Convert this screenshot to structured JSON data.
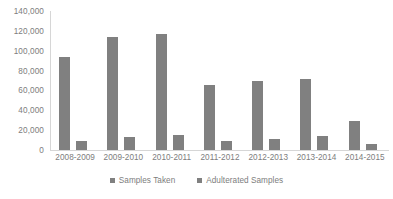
{
  "chart_data": {
    "type": "bar",
    "title": "",
    "subtitle": "",
    "xlabel": "",
    "ylabel": "",
    "grid": false,
    "legend_position": "bottom",
    "categories": [
      "2008-2009",
      "2009-2010",
      "2010-2011",
      "2011-2012",
      "2012-2013",
      "2013-2014",
      "2014-2015"
    ],
    "series": [
      {
        "name": "Samples Taken",
        "color": "#808080",
        "values": [
          94000,
          114000,
          117000,
          65000,
          70000,
          72000,
          29000
        ]
      },
      {
        "name": "Adulterated Samples",
        "color": "#808080",
        "values": [
          9000,
          13000,
          15000,
          9000,
          11000,
          14000,
          6000
        ]
      }
    ],
    "ylim": [
      0,
      140000
    ],
    "ytick_values": [
      140000,
      120000,
      100000,
      80000,
      60000,
      40000,
      20000,
      0
    ],
    "ytick_labels": [
      "140,000",
      "120,000",
      "100,000",
      "80,000",
      "60,000",
      "40,000",
      "20,000",
      "0"
    ],
    "axis_color": "#d6d6d6",
    "text_color": "#7d7d7d"
  }
}
